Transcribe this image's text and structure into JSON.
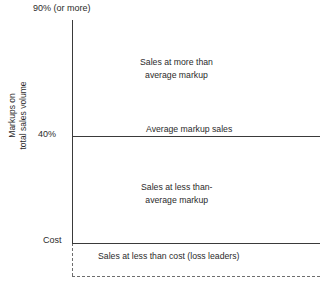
{
  "chart_data": {
    "type": "bar",
    "title": "",
    "subtitle": "",
    "xlabel": "",
    "ylabel": "Markups on total sales volume",
    "grid": false,
    "legend": "none",
    "orientation": "horizontal-bands",
    "ylim": [
      0,
      90
    ],
    "y_axis_ticks": [
      {
        "label": "90% (or more)",
        "value": 90
      },
      {
        "label": "40%",
        "value": 40
      },
      {
        "label": "Cost",
        "value": 0
      }
    ],
    "categories": [
      "Sales at more than average markup",
      "Average markup sales",
      "Sales at less than-average markup",
      "Sales at less than cost (loss leaders)"
    ],
    "values": [
      90,
      40,
      40,
      0
    ],
    "bands": [
      {
        "name": "above-average-markup",
        "label_line1": "Sales at more than",
        "label_line2": "average markup",
        "top_value": 90,
        "bottom_value": 40
      },
      {
        "name": "average-markup",
        "label_line1": "Average markup sales",
        "label_line2": "",
        "top_value": 40,
        "bottom_value": 40
      },
      {
        "name": "below-average-markup",
        "label_line1": "Sales at less than-",
        "label_line2": "average markup",
        "top_value": 40,
        "bottom_value": 0
      },
      {
        "name": "loss-leaders",
        "label_line1": "Sales at less than cost (loss leaders)",
        "label_line2": "",
        "top_value": 0,
        "bottom_value": -20
      }
    ],
    "annotations": [
      "90% (or more)",
      "40%",
      "Cost",
      "Sales at more than average markup",
      "Average markup sales",
      "Sales at less than-average markup",
      "Sales at less than cost (loss leaders)"
    ],
    "colors": {
      "axis": "#3a3a3a",
      "dashed": "#6d6d6d",
      "text": "#2b2b2b",
      "background": "#ffffff"
    }
  },
  "axis": {
    "y_title_line1": "Markups on",
    "y_title_line2": "total sales volume",
    "tick_top": "90% (or more)",
    "tick_mid": "40%",
    "tick_bottom": "Cost"
  },
  "bands": {
    "above": {
      "line1": "Sales at more than",
      "line2": "average markup"
    },
    "average": {
      "line1": "Average markup sales"
    },
    "below": {
      "line1": "Sales at less than-",
      "line2": "average markup"
    },
    "loss": {
      "line1": "Sales at less than cost (loss leaders)"
    }
  }
}
